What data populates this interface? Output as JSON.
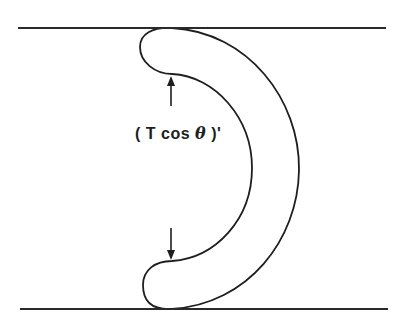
{
  "diagram": {
    "label": {
      "open": "( T cos ",
      "symbol": "θ",
      "close": " )'"
    },
    "elements": [
      "top-boundary-line",
      "bottom-boundary-line",
      "curved-tube-shape",
      "upper-arrow",
      "lower-arrow"
    ]
  }
}
